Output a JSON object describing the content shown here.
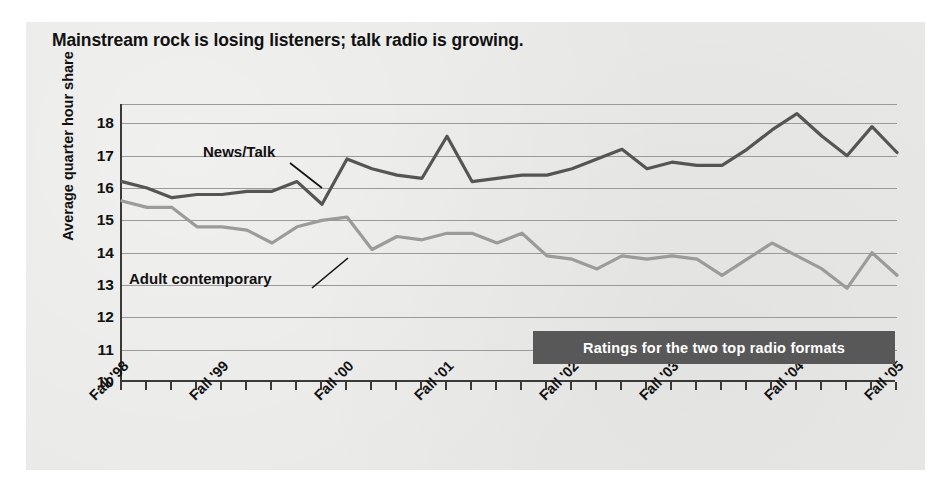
{
  "chart_data": {
    "type": "line",
    "title": "Mainstream rock is losing listeners; talk radio is growing.",
    "xlabel": "",
    "ylabel": "Average quarter hour share",
    "ylim": [
      10,
      18.6
    ],
    "yticks": [
      10,
      11,
      12,
      13,
      14,
      15,
      16,
      17,
      18
    ],
    "grid": true,
    "legend_position": "inline-annotations",
    "banner": "Ratings for the two top radio formats",
    "xtick_labels": [
      "Fall '98",
      "Fall '99",
      "Fall '00",
      "Fall '01",
      "Fall '02",
      "Fall '03",
      "Fall '04",
      "Fall '05"
    ],
    "xtick_indices": [
      0,
      4,
      9,
      13,
      18,
      22,
      27,
      31
    ],
    "n_points": 32,
    "series": [
      {
        "name": "News/Talk",
        "color": "#555553",
        "values": [
          16.2,
          16.0,
          15.7,
          15.8,
          15.8,
          15.9,
          15.9,
          16.2,
          15.5,
          16.9,
          16.6,
          16.4,
          16.3,
          17.6,
          16.2,
          16.3,
          16.4,
          16.4,
          16.6,
          16.9,
          17.2,
          16.6,
          16.8,
          16.7,
          16.7,
          17.2,
          17.8,
          18.3,
          17.6,
          17.0,
          17.9,
          17.1
        ]
      },
      {
        "name": "Adult contemporary",
        "color": "#9b9b99",
        "values": [
          15.6,
          15.4,
          15.4,
          14.8,
          14.8,
          14.7,
          14.3,
          14.8,
          15.0,
          15.1,
          14.1,
          14.5,
          14.4,
          14.6,
          14.6,
          14.3,
          14.6,
          13.9,
          13.8,
          13.5,
          13.9,
          13.8,
          13.9,
          13.8,
          13.3,
          13.8,
          14.3,
          13.9,
          13.5,
          12.9,
          14.0,
          13.3
        ]
      }
    ],
    "annotations": [
      {
        "text": "News/Talk",
        "series": "News/Talk"
      },
      {
        "text": "Adult contemporary",
        "series": "Adult contemporary"
      }
    ]
  }
}
